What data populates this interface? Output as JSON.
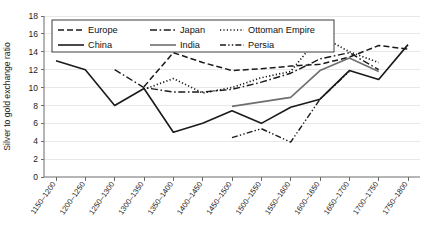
{
  "chart_data": {
    "type": "line",
    "title": "",
    "xlabel": "",
    "ylabel": "Silver to gold exchange ratio",
    "ylim": [
      0,
      18
    ],
    "ytick_step": 2,
    "grid": "horizontal",
    "legend_position": "top-left-inside",
    "categories": [
      "1150–1200",
      "1200–1250",
      "1250–1300",
      "1300–1350",
      "1350–1400",
      "1400–1450",
      "1450–1500",
      "1500–1550",
      "1550–1600",
      "1600–1650",
      "1650–1700",
      "1700–1750",
      "1750–1800"
    ],
    "yticks": [
      0,
      2,
      4,
      6,
      8,
      10,
      12,
      14,
      16,
      18
    ],
    "series": [
      {
        "name": "Europe",
        "style": "dashed",
        "color": "#1a1a1a",
        "width": 1.5,
        "dash": "6,3",
        "values": [
          null,
          null,
          null,
          10.1,
          13.9,
          12.8,
          11.9,
          12.1,
          12.4,
          12.6,
          13.4,
          14.7,
          14.3
        ]
      },
      {
        "name": "Japan",
        "style": "dash-dot",
        "color": "#1a1a1a",
        "width": 1.4,
        "dash": "7,2.6,1.6,2.6",
        "values": [
          null,
          null,
          12.0,
          10.0,
          9.5,
          9.5,
          9.8,
          10.6,
          11.6,
          13.2,
          13.9,
          12.0,
          null
        ]
      },
      {
        "name": "Ottoman Empire",
        "style": "dotted",
        "color": "#1a1a1a",
        "width": 1.7,
        "dash": "1.2,2.2",
        "values": [
          null,
          null,
          null,
          9.8,
          11.0,
          9.4,
          10.0,
          11.1,
          11.8,
          15.8,
          14.0,
          12.8,
          null
        ]
      },
      {
        "name": "China",
        "style": "solid",
        "color": "#1a1a1a",
        "width": 1.6,
        "dash": "none",
        "values": [
          13.0,
          12.0,
          8.0,
          9.9,
          5.0,
          6.0,
          7.4,
          6.0,
          7.8,
          8.7,
          11.9,
          10.9,
          14.8
        ]
      },
      {
        "name": "India",
        "style": "solid",
        "color": "#6e6e6e",
        "width": 1.6,
        "dash": "none",
        "values": [
          null,
          null,
          null,
          null,
          null,
          null,
          7.9,
          8.4,
          8.9,
          11.9,
          13.3,
          11.8,
          null
        ]
      },
      {
        "name": "Persia",
        "style": "dash-dot-dot",
        "color": "#1a1a1a",
        "width": 1.4,
        "dash": "6,2.2,1.4,2.2,1.4,2.2",
        "values": [
          null,
          null,
          null,
          null,
          null,
          null,
          4.4,
          5.4,
          3.9,
          8.7,
          11.8,
          null,
          null
        ]
      }
    ]
  },
  "legend": {
    "entries": [
      {
        "label": "Europe"
      },
      {
        "label": "Japan"
      },
      {
        "label": "Ottoman Empire"
      },
      {
        "label": "China"
      },
      {
        "label": "India"
      },
      {
        "label": "Persia"
      }
    ]
  }
}
